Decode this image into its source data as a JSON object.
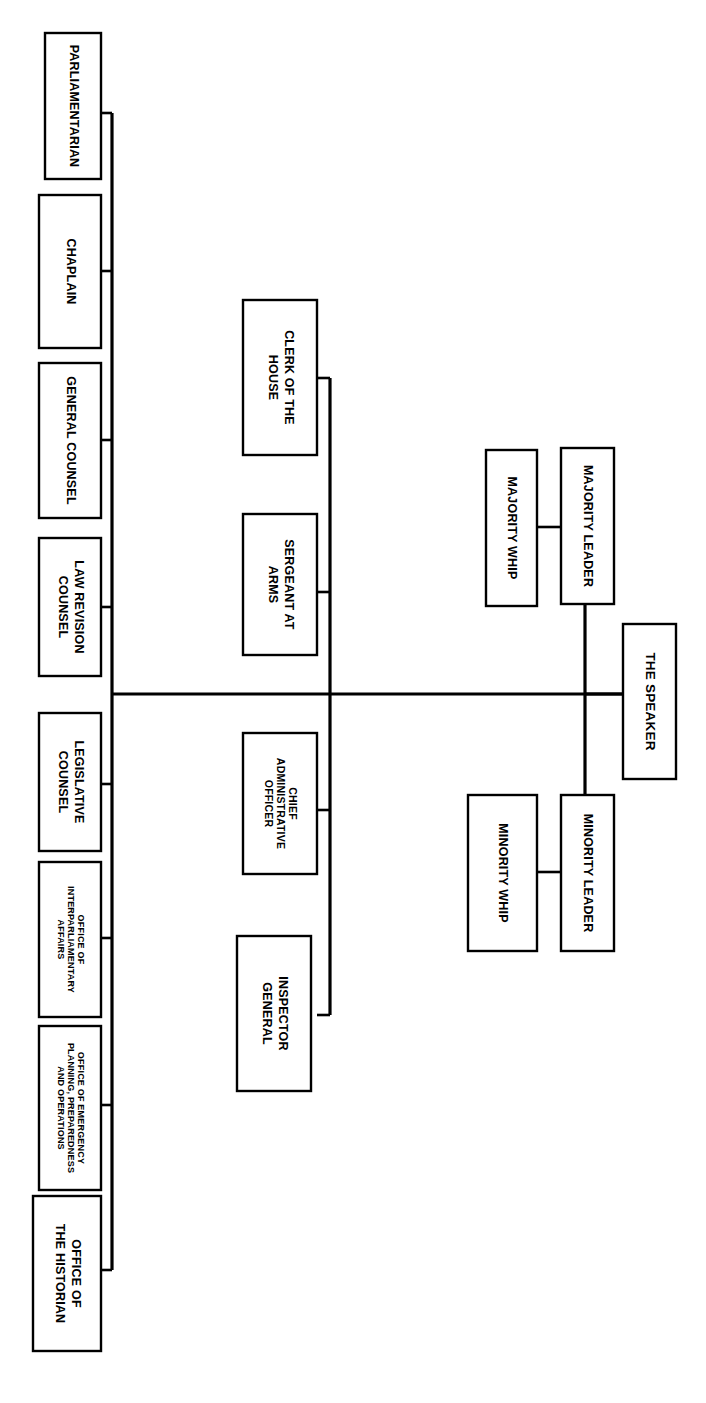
{
  "chart": {
    "orientation": "rotated-90-counterclockwise",
    "line_color": "#000000",
    "box_fill": "#ffffff",
    "background": "#ffffff"
  },
  "nodes": {
    "speaker": {
      "label": "THE SPEAKER"
    },
    "majority_leader": {
      "label": "MAJORITY LEADER"
    },
    "majority_whip": {
      "label": "MAJORITY WHIP"
    },
    "minority_leader": {
      "label": "MINORITY LEADER"
    },
    "minority_whip": {
      "label": "MINORITY WHIP"
    },
    "clerk": {
      "label": "CLERK OF THE HOUSE"
    },
    "sergeant": {
      "label": "SERGEANT AT ARMS"
    },
    "cao": {
      "label": "CHIEF ADMINISTRATIVE OFFICER"
    },
    "inspector": {
      "label": "INSPECTOR GENERAL"
    },
    "parliamentarian": {
      "label": "PARLIAMENTARIAN"
    },
    "chaplain": {
      "label": "CHAPLAIN"
    },
    "general_counsel": {
      "label": "GENERAL COUNSEL"
    },
    "law_revision": {
      "label": "LAW REVISION COUNSEL"
    },
    "legislative_counsel": {
      "label": "LEGISLATIVE COUNSEL"
    },
    "interparliamentary": {
      "label": "OFFICE OF INTERPARLIAMENTARY AFFAIRS"
    },
    "emergency": {
      "label": "OFFICE OF EMERGENCY PLANNING, PREPAREDNESS AND OPERATIONS"
    },
    "historian": {
      "label": "OFFICE OF THE HISTORIAN"
    }
  },
  "node_lines": {
    "speaker": [
      "THE SPEAKER"
    ],
    "majority_leader": [
      "MAJORITY LEADER"
    ],
    "majority_whip": [
      "MAJORITY WHIP"
    ],
    "minority_leader": [
      "MINORITY LEADER"
    ],
    "minority_whip": [
      "MINORITY WHIP"
    ],
    "clerk": [
      "CLERK OF THE",
      "HOUSE"
    ],
    "sergeant": [
      "SERGEANT AT",
      "ARMS"
    ],
    "cao": [
      "CHIEF",
      "ADMINISTRATIVE",
      "OFFICER"
    ],
    "inspector": [
      "INSPECTOR",
      "GENERAL"
    ],
    "parliamentarian": [
      "PARLIAMENTARIAN"
    ],
    "chaplain": [
      "CHAPLAIN"
    ],
    "general_counsel": [
      "GENERAL COUNSEL"
    ],
    "law_revision": [
      "LAW REVISION",
      "COUNSEL"
    ],
    "legislative_counsel": [
      "LEGISLATIVE",
      "COUNSEL"
    ],
    "interparliamentary": [
      "OFFICE OF",
      "INTERPARLIAMENTARY",
      "AFFAIRS"
    ],
    "emergency": [
      "OFFICE OF EMERGENCY",
      "PLANNING, PREPAREDNESS",
      "AND OPERATIONS"
    ],
    "historian": [
      "OFFICE OF",
      "THE HISTORIAN"
    ]
  }
}
